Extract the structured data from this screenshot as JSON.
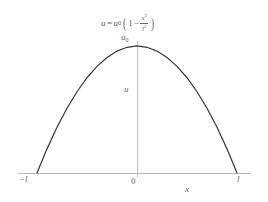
{
  "chart_data": {
    "type": "line",
    "title": "",
    "equation": {
      "lhs_variable": "u",
      "equals": "=",
      "amplitude_symbol": "u",
      "amplitude_subscript": "0",
      "open_paren": "(",
      "one": "1",
      "minus": "−",
      "numerator": "x",
      "numerator_exponent": "2",
      "denominator": "l",
      "denominator_exponent": "2",
      "close_paren": ")",
      "plain_text": "u = u0 (1 − x²/l²)"
    },
    "xlabel": "x",
    "ylabel": "u",
    "x_tick_labels": [
      "−l",
      "0",
      "l"
    ],
    "x_tick_values": [
      -1,
      0,
      1
    ],
    "y_tick_labels": [
      "u0"
    ],
    "y_peak_label_symbol": "u",
    "y_peak_label_subscript": "0",
    "xlim": [
      -1.17,
      1.12
    ],
    "ylim": [
      0,
      1.04
    ],
    "grid": false,
    "legend": null,
    "x": [
      -1.0,
      -0.9,
      -0.8,
      -0.7,
      -0.6,
      -0.5,
      -0.4,
      -0.3,
      -0.2,
      -0.1,
      0.0,
      0.1,
      0.2,
      0.3,
      0.4,
      0.5,
      0.6,
      0.7,
      0.8,
      0.9,
      1.0
    ],
    "values": [
      0.0,
      0.19,
      0.36,
      0.51,
      0.64,
      0.75,
      0.84,
      0.91,
      0.96,
      0.99,
      1.0,
      0.99,
      0.96,
      0.91,
      0.84,
      0.75,
      0.64,
      0.51,
      0.36,
      0.19,
      0.0
    ],
    "series": [
      {
        "name": "u(x)",
        "values": [
          0.0,
          0.19,
          0.36,
          0.51,
          0.64,
          0.75,
          0.84,
          0.91,
          0.96,
          0.99,
          1.0,
          0.99,
          0.96,
          0.91,
          0.84,
          0.75,
          0.64,
          0.51,
          0.36,
          0.19,
          0.0
        ]
      }
    ],
    "colors": {
      "curve": "#3a3a3a",
      "axis": "#b6b6b6",
      "text": "#666666",
      "background": "#ffffff"
    }
  }
}
